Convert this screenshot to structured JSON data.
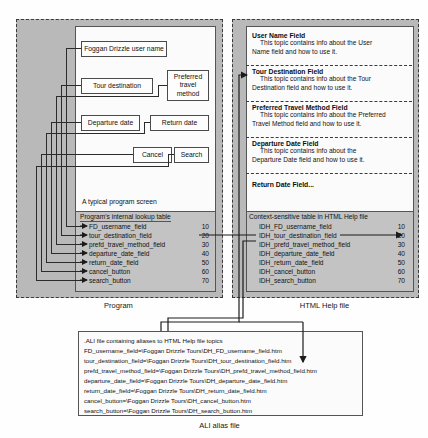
{
  "diagram": {
    "regions": {
      "program": {
        "label": "Program"
      },
      "help": {
        "label": "HTML Help file"
      },
      "ali": {
        "label": "ALI alias file"
      }
    },
    "program_screen": {
      "caption": "A typical program screen",
      "widgets": [
        {
          "name": "user-name-field",
          "label": "Foggan Drizzle user name"
        },
        {
          "name": "tour-destination-field",
          "label": "Tour destination"
        },
        {
          "name": "preferred-travel-method-field",
          "label": "Preferred travel method"
        },
        {
          "name": "departure-date-field",
          "label": "Departure date"
        },
        {
          "name": "return-date-field",
          "label": "Return date"
        },
        {
          "name": "cancel-button",
          "label": "Cancel"
        },
        {
          "name": "search-button",
          "label": "Search"
        }
      ]
    },
    "lookup_table": {
      "title": "Program's internal lookup table",
      "rows": [
        {
          "id": "FD_usernamе_field",
          "value": "10"
        },
        {
          "id": "tour_destination_field",
          "value": "20"
        },
        {
          "id": "prefd_travel_method_field",
          "value": "30"
        },
        {
          "id": "departure_date_field",
          "value": "40"
        },
        {
          "id": "return_date_field",
          "value": "50"
        },
        {
          "id": "cancel_button",
          "value": "60"
        },
        {
          "id": "search_button",
          "value": "70"
        }
      ]
    },
    "help_topics": [
      {
        "head": "User Name Field",
        "body1": "This topic contains info about the User",
        "body2": "Name field and how to use it."
      },
      {
        "head": "Tour Destination Field",
        "body1": "This topic contains info about the Tour",
        "body2": "Destination field and how to use it."
      },
      {
        "head": "Preferred Travel Method Field",
        "body1": "This topic contains info about the Preferred",
        "body2": "Travel Method field and how to use it."
      },
      {
        "head": "Departure Date Field",
        "body1": "This topic contains info about the",
        "body2": "Departure Date field and how to use it."
      },
      {
        "head": "Return Date Field...",
        "body1": "",
        "body2": ""
      }
    ],
    "context_table": {
      "title": "Context-sensitive table in HTML Help file",
      "rows": [
        {
          "id": "IDH_FD_username_field",
          "value": "10"
        },
        {
          "id": "IDH_tour_destination_field",
          "value": "20"
        },
        {
          "id": "IDH_prefd_travel_method_field",
          "value": "30"
        },
        {
          "id": "IDH_departure_date_field",
          "value": "40"
        },
        {
          "id": "IDH_return_date_field",
          "value": "50"
        },
        {
          "id": "IDH_cancel_button",
          "value": "60"
        },
        {
          "id": "IDH_search_button",
          "value": "70"
        }
      ]
    },
    "ali_file": {
      "title": ".ALI file containing aliases to HTML Help file topics",
      "lines": [
        "FD_usernamе_field=\\Foggan Drizzle Tours\\DH_FD_username_field.htm",
        "tour_destination_field=\\Foggan Drizzle Tours\\DH_tour_destination_field.htm",
        "prefd_travel_method_field=\\Foggan Drizzle Tours\\DH_prefd_travel_method_field.htm",
        "departure_date_field=\\Foggan Drizzle Tours\\DH_departure_date_field.htm",
        "return_date_field=\\Foggan Drizzle Tours\\DH_return_date_field.htm",
        "cancel_button=\\Foggan Drizzle Tours\\DH_cancel_button.htm",
        "search_button=\\Foggan Drizzle Tours\\DH_search_button.htm"
      ]
    },
    "colors": {
      "region_fill": "#b9b9b9",
      "table_fill": "#c3c3c3",
      "card_fill": "#fbfbfb",
      "line": "#2b2b2b"
    }
  }
}
